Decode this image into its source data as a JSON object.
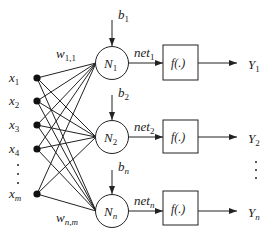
{
  "diagram": {
    "type": "single-layer neural network",
    "inputs": [
      {
        "label": "x",
        "sub": "1"
      },
      {
        "label": "x",
        "sub": "2"
      },
      {
        "label": "x",
        "sub": "3"
      },
      {
        "label": "x",
        "sub": "4"
      },
      {
        "label": "x",
        "sub": "m"
      }
    ],
    "input_ellipsis": "⋮",
    "weights": {
      "first": {
        "label": "w",
        "sub": "1,1"
      },
      "last": {
        "label": "w",
        "sub": "n,m"
      }
    },
    "neurons": [
      {
        "label": "N",
        "sub": "1",
        "bias": "b",
        "bias_sub": "1",
        "net": "net",
        "net_sub": "1",
        "func": "f(.)",
        "out": "Y",
        "out_sub": "1"
      },
      {
        "label": "N",
        "sub": "2",
        "bias": "b",
        "bias_sub": "2",
        "net": "net",
        "net_sub": "2",
        "func": "f(.)",
        "out": "Y",
        "out_sub": "2"
      },
      {
        "label": "N",
        "sub": "n",
        "bias": "b",
        "bias_sub": "n",
        "net": "net",
        "net_sub": "n",
        "func": "f(.)",
        "out": "Y",
        "out_sub": "n"
      }
    ],
    "output_ellipsis": "⋮",
    "colors": {
      "stroke": "#222222",
      "background": "#ffffff"
    }
  }
}
